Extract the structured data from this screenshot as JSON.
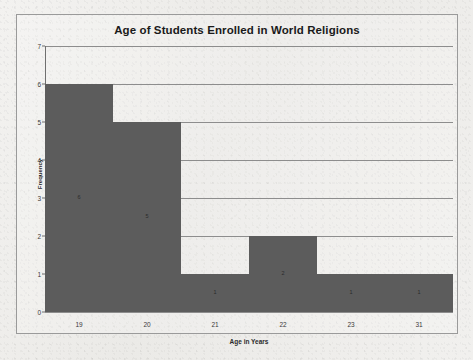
{
  "chart_data": {
    "type": "bar",
    "title": "Age of Students Enrolled in World Religions",
    "xlabel": "Age in Years",
    "ylabel": "Frequency",
    "categories": [
      "19",
      "20",
      "21",
      "22",
      "23",
      "31"
    ],
    "values": [
      6,
      5,
      1,
      2,
      1,
      1
    ],
    "data_labels": [
      "6",
      "5",
      "1",
      "2",
      "1",
      "1"
    ],
    "ylim": [
      0,
      7
    ],
    "ytick_labels": [
      "0",
      "1",
      "2",
      "3",
      "4",
      "5",
      "6",
      "7"
    ],
    "grid": true,
    "legend": "none",
    "bar_color": "#5c5c5c",
    "gridline_color": "#8d8d8d",
    "axis_color": "#6f6f6f",
    "background_color": "#efeeec"
  }
}
